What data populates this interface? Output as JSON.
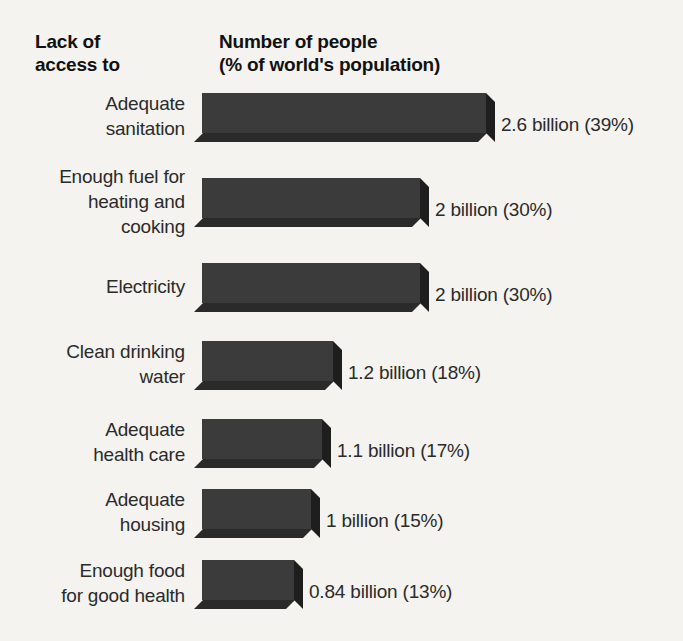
{
  "header": {
    "left": "Lack of\naccess to",
    "right": "Number of people\n(% of world's population)"
  },
  "colors": {
    "background": "#f4f3ef",
    "bar_front": "#3b3b3b",
    "bar_bottom": "#2a2a2a",
    "bar_side": "#1e1e1e",
    "text": "#2b2b2b"
  },
  "chart_data": {
    "type": "bar",
    "orientation": "horizontal",
    "title": "Lack of access to",
    "subtitle": "Number of people (% of world's population)",
    "xlabel": "Number of people (% of world's population)",
    "ylabel": "Lack of access to",
    "grid": false,
    "legend": false,
    "units": "billions of people",
    "xlim": [
      0,
      2.6
    ],
    "categories": [
      "Adequate sanitation",
      "Enough fuel for heating and cooking",
      "Electricity",
      "Clean drinking water",
      "Adequate health care",
      "Adequate housing",
      "Enough food for good health"
    ],
    "values": [
      2.6,
      2,
      2,
      1.2,
      1.1,
      1,
      0.84
    ],
    "percentages": [
      39,
      30,
      30,
      18,
      17,
      15,
      13
    ],
    "data_labels": [
      "2.6 billion (39%)",
      "2 billion (30%)",
      "2 billion (30%)",
      "1.2 billion (18%)",
      "1.1 billion (17%)",
      "1 billion (15%)",
      "0.84 billion (13%)"
    ]
  },
  "rows": [
    {
      "label": "Adequate\nsanitation",
      "value_label": "2.6 billion (39%)",
      "value": 2.6,
      "percent": 39
    },
    {
      "label": "Enough fuel for\nheating and\ncooking",
      "value_label": "2 billion (30%)",
      "value": 2,
      "percent": 30
    },
    {
      "label": "Electricity",
      "value_label": "2 billion (30%)",
      "value": 2,
      "percent": 30
    },
    {
      "label": "Clean drinking\nwater",
      "value_label": "1.2 billion (18%)",
      "value": 1.2,
      "percent": 18
    },
    {
      "label": "Adequate\nhealth care",
      "value_label": "1.1 billion (17%)",
      "value": 1.1,
      "percent": 17
    },
    {
      "label": "Adequate\nhousing",
      "value_label": "1 billion (15%)",
      "value": 1,
      "percent": 15
    },
    {
      "label": "Enough food\nfor good health",
      "value_label": "0.84 billion (13%)",
      "value": 0.84,
      "percent": 13
    }
  ]
}
